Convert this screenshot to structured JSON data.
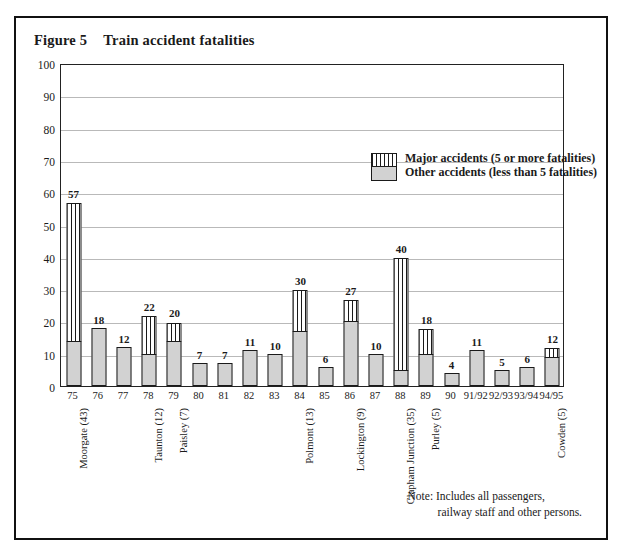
{
  "page": {
    "scan_sliver_text": " ",
    "figure_number": "Figure 5",
    "title": "Train accident fatalities"
  },
  "legend": {
    "position": "inside-top-right",
    "entries": [
      {
        "key": "major",
        "label": "Major accidents (5 or more fatalities)",
        "pattern": "vertical-stripes",
        "color": "#ffffff"
      },
      {
        "key": "other",
        "label": "Other accidents (less than 5 fatalities)",
        "pattern": "solid",
        "color": "#d2d2d2"
      }
    ]
  },
  "note": {
    "line1": "Note:  Includes all passengers,",
    "line2": "railway staff and other persons."
  },
  "chart_data": {
    "type": "bar",
    "subtype": "stacked-vertical",
    "title": "Train accident fatalities",
    "xlabel": "",
    "ylabel": "",
    "ylim": [
      0,
      100
    ],
    "ytick_labels": [
      "0",
      "10",
      "20",
      "30",
      "40",
      "50",
      "60",
      "70",
      "80",
      "90",
      "100"
    ],
    "yticks": [
      0,
      10,
      20,
      30,
      40,
      50,
      60,
      70,
      80,
      90,
      100
    ],
    "grid": true,
    "categories": [
      "75",
      "76",
      "77",
      "78",
      "79",
      "80",
      "81",
      "82",
      "83",
      "84",
      "85",
      "86",
      "87",
      "88",
      "89",
      "90",
      "91/92",
      "92/93",
      "93/94",
      "94/95"
    ],
    "series": [
      {
        "name": "Other accidents (less than 5 fatalities)",
        "values": [
          14,
          18,
          12,
          10,
          14,
          7,
          7,
          11,
          10,
          17,
          6,
          20,
          10,
          5,
          10,
          4,
          11,
          5,
          6,
          9
        ]
      },
      {
        "name": "Major accidents (5 or more fatalities)",
        "values": [
          43,
          0,
          0,
          12,
          6,
          0,
          0,
          0,
          0,
          13,
          0,
          7,
          0,
          35,
          8,
          0,
          0,
          0,
          0,
          3
        ]
      }
    ],
    "totals": [
      57,
      18,
      12,
      22,
      20,
      7,
      7,
      11,
      10,
      30,
      6,
      27,
      10,
      40,
      18,
      4,
      11,
      5,
      6,
      12
    ],
    "data_labels": [
      "57",
      "18",
      "12",
      "22",
      "20",
      "7",
      "7",
      "11",
      "10",
      "30",
      "6",
      "27",
      "10",
      "40",
      "18",
      "4",
      "11",
      "5",
      "6",
      "12"
    ],
    "annotations": [
      {
        "category": "75",
        "text": "Moorgate (43)"
      },
      {
        "category": "78",
        "text": "Taunton (12)"
      },
      {
        "category": "79",
        "text": "Paisley (7)"
      },
      {
        "category": "84",
        "text": "Polmont (13)"
      },
      {
        "category": "86",
        "text": "Lockington (9)"
      },
      {
        "category": "88",
        "text": "Clapham Junction (35)"
      },
      {
        "category": "89",
        "text": "Purley (5)"
      },
      {
        "category": "94/95",
        "text": "Cowden (5)"
      }
    ]
  }
}
